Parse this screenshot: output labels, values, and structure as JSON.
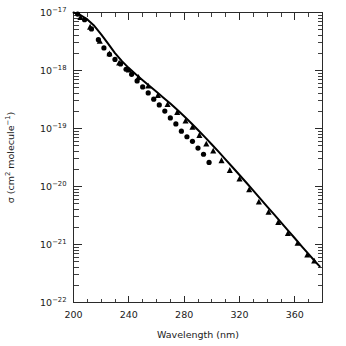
{
  "chart_data": {
    "type": "scatter",
    "title": "",
    "xlabel": "Wavelength (nm)",
    "ylabel": "σ (cm² molecule⁻¹)",
    "ylabel_parts": {
      "symbol": "σ",
      "open": " (cm",
      "sup1": "2",
      "mid": " molecule",
      "sup2": "−1",
      "close": ")"
    },
    "xlim": [
      200,
      380
    ],
    "ylim": [
      1e-22,
      1e-17
    ],
    "yscale": "log",
    "xscale": "linear",
    "grid": false,
    "legend": "none",
    "x_ticks_major": [
      200,
      240,
      280,
      320,
      360
    ],
    "x_tick_labels": [
      "200",
      "240",
      "280",
      "320",
      "360"
    ],
    "x_ticks_minor": [
      210,
      220,
      230,
      250,
      260,
      270,
      290,
      300,
      310,
      330,
      340,
      350,
      370
    ],
    "y_ticks_major": [
      1e-17,
      1e-18,
      1e-19,
      1e-20,
      1e-21,
      1e-22
    ],
    "y_tick_labels": [
      "10⁻¹⁷",
      "10⁻¹⁸",
      "10⁻¹⁹",
      "10⁻²⁰",
      "10⁻²¹",
      "10⁻²²"
    ],
    "y_tick_mantissa": "10",
    "y_tick_exponents": [
      "-17",
      "-18",
      "-19",
      "-20",
      "-21",
      "-22"
    ],
    "series": [
      {
        "name": "fitted curve",
        "type": "line",
        "marker": "none",
        "color": "#000000",
        "x": [
          200,
          205,
          210,
          215,
          220,
          225,
          230,
          235,
          240,
          245,
          250,
          255,
          260,
          265,
          270,
          275,
          280,
          285,
          290,
          295,
          300,
          305,
          310,
          315,
          320,
          325,
          330,
          335,
          340,
          345,
          350,
          355,
          360,
          365,
          370,
          375,
          378
        ],
        "y": [
          1e-17,
          9e-18,
          7.6e-18,
          5.9e-18,
          4.2e-18,
          2.9e-18,
          2e-18,
          1.45e-18,
          1.1e-18,
          8.6e-19,
          6.8e-19,
          5.4e-19,
          4.3e-19,
          3.4e-19,
          2.7e-19,
          2.1e-19,
          1.62e-19,
          1.24e-19,
          9.4e-20,
          7.1e-20,
          5.3e-20,
          3.95e-20,
          2.9e-20,
          2.15e-20,
          1.58e-20,
          1.16e-20,
          8.5e-21,
          6.2e-21,
          4.5e-21,
          3.3e-21,
          2.4e-21,
          1.75e-21,
          1.28e-21,
          9.3e-22,
          6.8e-22,
          5e-22,
          4.2e-22
        ]
      },
      {
        "name": "circle data",
        "type": "scatter",
        "marker": "circle",
        "color": "#000000",
        "x": [
          203,
          208,
          213,
          218,
          222,
          226,
          230,
          234,
          238,
          242,
          246,
          250,
          254,
          258,
          262,
          266,
          270,
          274,
          278,
          282,
          286,
          290,
          294,
          298
        ],
        "y": [
          9.4e-18,
          7.5e-18,
          5.2e-18,
          3.4e-18,
          2.45e-18,
          1.9e-18,
          1.55e-18,
          1.3e-18,
          1.05e-18,
          8.6e-19,
          6.6e-19,
          5.2e-19,
          4.1e-19,
          3.2e-19,
          2.55e-19,
          2e-19,
          1.52e-19,
          1.2e-19,
          9e-20,
          7.2e-20,
          6e-20,
          4.6e-20,
          3.6e-20,
          2.6e-20
        ]
      },
      {
        "name": "triangle data",
        "type": "scatter",
        "marker": "triangle",
        "color": "#000000",
        "x": [
          205,
          212,
          219,
          226,
          233,
          240,
          247,
          254,
          261,
          268,
          275,
          281,
          286,
          291,
          296,
          301,
          307,
          313,
          320,
          327,
          334,
          341,
          348,
          355,
          362,
          369,
          374
        ],
        "y": [
          8.2e-18,
          5.6e-18,
          3.2e-18,
          1.95e-18,
          1.35e-18,
          1.02e-18,
          7.6e-19,
          5.4e-19,
          3.7e-19,
          2.6e-19,
          1.9e-19,
          1.35e-19,
          1.05e-19,
          7.6e-20,
          5.4e-20,
          4.1e-20,
          2.8e-20,
          1.9e-20,
          1.35e-20,
          8.8e-21,
          5.4e-21,
          3.6e-21,
          2.4e-21,
          1.55e-21,
          1.05e-21,
          6.6e-22,
          5.2e-22
        ]
      }
    ]
  },
  "colors": {
    "axis": "#2a2a2a",
    "data": "#000000",
    "background": "#ffffff"
  }
}
